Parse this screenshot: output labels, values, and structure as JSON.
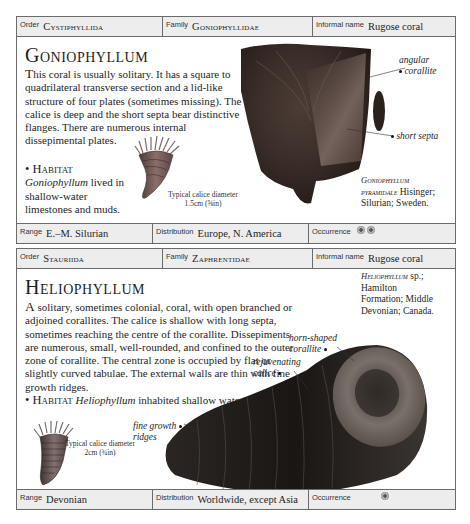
{
  "entries": [
    {
      "header": {
        "order_label": "Order",
        "order_value": "Cystiphyllida",
        "family_label": "Family",
        "family_value": "Goniophyllidae",
        "informal_label": "Informal name",
        "informal_value": "Rugose coral"
      },
      "title": "Goniophyllum",
      "description_lead": "T",
      "description": "his coral is usually solitary. It has a square to quadrilateral transverse section and a lid-like structure of four plates (sometimes missing). The calice is deep and the short septa bear distinctive flanges. There are numerous internal dissepimental plates.",
      "habitat_label": "• Habitat",
      "habitat_genus": "Goniophyllum",
      "habitat_text": " lived in shallow-water limestones and muds.",
      "illustration_caption_line1": "Typical calice diameter",
      "illustration_caption_line2": "1.5cm (⅝in)",
      "annotations": [
        {
          "line1": "angular",
          "line2": "corallite"
        },
        {
          "line1": "short septa",
          "line2": ""
        }
      ],
      "specimen": {
        "name_line1": "Goniophyllum",
        "name_line2": "pyramidale",
        "author": " Hisinger;",
        "locality": "Silurian; Sweden."
      },
      "footer": {
        "range_label": "Range",
        "range_value": "E.–M. Silurian",
        "distribution_label": "Distribution",
        "distribution_value": "Europe, N. America",
        "occurrence_label": "Occurrence",
        "occurrence_count": 2
      }
    },
    {
      "header": {
        "order_label": "Order",
        "order_value": "Stauriida",
        "family_label": "Family",
        "family_value": "Zaphrentidae",
        "informal_label": "Informal name",
        "informal_value": "Rugose coral"
      },
      "title": "Heliophyllum",
      "description_lead": "A",
      "description": " solitary, sometimes colonial, coral, with open branched or adjoined corallites. The calice is shallow with long septa, sometimes reaching the centre of the corallite. Dissepiments are numerous, small, well-rounded, and confined to the outer zone of corallite. The central zone is occupied by flat or slightly curved tabulae. The external walls are thin with fine growth ridges.",
      "habitat_label": "• Habitat",
      "habitat_genus": "Heliophyllum",
      "habitat_text": " inhabited shallow water.",
      "illustration_caption_line1": "Typical calice diameter",
      "illustration_caption_line2": "2cm (¾in)",
      "annotations": [
        {
          "line1": "horn-shaped",
          "line2": "corallite"
        },
        {
          "line1": "rejuvenating",
          "line2": "calice"
        },
        {
          "line1": "fine growth",
          "line2": "ridges"
        }
      ],
      "specimen": {
        "name_line1": "Heliophyllum",
        "name_suffix": " sp.;",
        "line2": "Hamilton",
        "line3": "Formation; Middle",
        "line4": "Devonian; Canada."
      },
      "footer": {
        "range_label": "Range",
        "range_value": "Devonian",
        "distribution_label": "Distribution",
        "distribution_value": "Worldwide, except Asia",
        "occurrence_label": "Occurrence",
        "occurrence_count": 1
      }
    }
  ]
}
